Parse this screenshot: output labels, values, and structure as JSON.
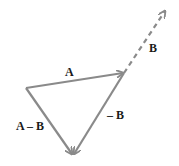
{
  "diagram": {
    "colors": {
      "vector": "#8a8a8a",
      "label": "#1a1a1a"
    },
    "vectors": [
      {
        "id": "A",
        "label": "A",
        "style": "solid"
      },
      {
        "id": "B",
        "label": "B",
        "style": "dashed"
      },
      {
        "id": "negB",
        "label": "– B",
        "style": "solid"
      },
      {
        "id": "AminusB",
        "label": "A – B",
        "style": "solid"
      }
    ]
  }
}
